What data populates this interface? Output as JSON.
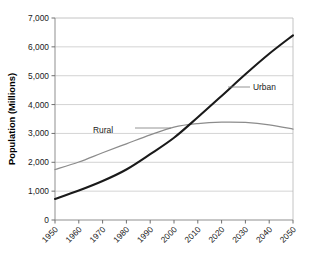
{
  "chart_data": {
    "type": "line",
    "title": "",
    "subtitle": "",
    "xlabel": "",
    "ylabel": "Population (Millions)",
    "xlim": [
      1950,
      2050
    ],
    "ylim": [
      0,
      7000
    ],
    "grid": true,
    "grid_axis": "y",
    "legend_position": "inline-annotation",
    "x_tick_labels": [
      "1950",
      "1960",
      "1970",
      "1980",
      "1990",
      "2000",
      "2010",
      "2020",
      "2030",
      "2040",
      "2050"
    ],
    "y_tick_labels": [
      "0",
      "1,000",
      "2,000",
      "3,000",
      "4,000",
      "5,000",
      "6,000",
      "7,000"
    ],
    "y_tick_values": [
      0,
      1000,
      2000,
      3000,
      4000,
      5000,
      6000,
      7000
    ],
    "x": [
      1950,
      1960,
      1970,
      1980,
      1990,
      2000,
      2010,
      2020,
      2030,
      2040,
      2050
    ],
    "series": [
      {
        "name": "Urban",
        "color": "#1a1a1a",
        "width": 2.1,
        "values": [
          730,
          1020,
          1350,
          1750,
          2280,
          2850,
          3560,
          4300,
          5050,
          5760,
          6400
        ]
      },
      {
        "name": "Rural",
        "color": "#8c8c8c",
        "width": 1.3,
        "values": [
          1750,
          2010,
          2330,
          2640,
          2950,
          3220,
          3340,
          3390,
          3380,
          3300,
          3150
        ]
      }
    ],
    "annotations": [
      {
        "text": "Urban",
        "series": "Urban",
        "label_x": 253,
        "label_y": 87,
        "leader_from_x": 228,
        "leader_to_x": 250,
        "leader_y": 87
      },
      {
        "text": "Rural",
        "series": "Rural",
        "label_x": 113,
        "label_y": 130,
        "leader_from_x": 135,
        "leader_to_x": 171,
        "leader_y": 128
      }
    ],
    "colors": {
      "urban": "#1a1a1a",
      "rural": "#8c8c8c",
      "gridline": "#c8c8c8",
      "axis": "#9a9a9a",
      "background": "#ffffff",
      "text": "#1a1a1a"
    }
  }
}
